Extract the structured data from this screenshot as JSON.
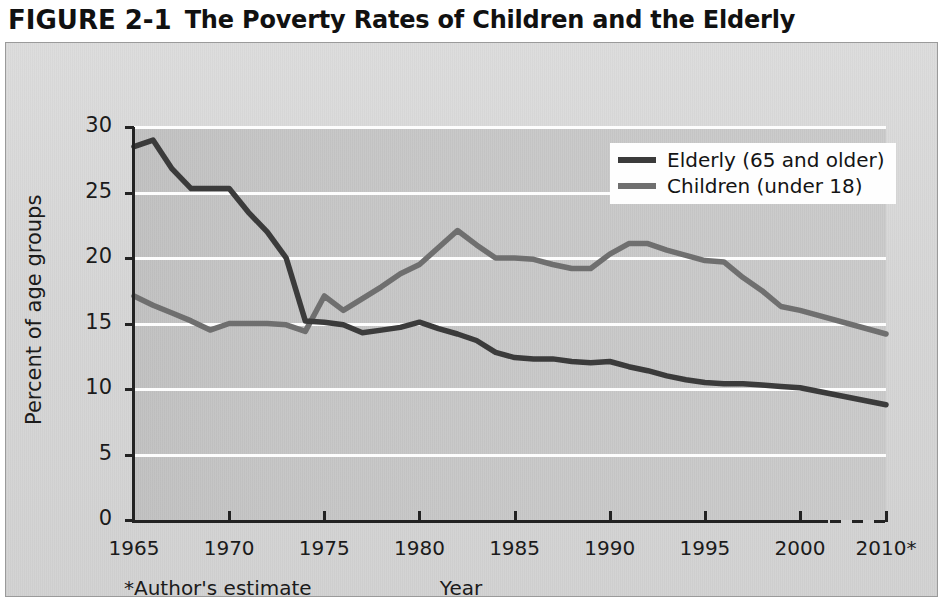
{
  "figure": {
    "number": "FIGURE 2-1",
    "title": "The Poverty Rates of Children and the Elderly"
  },
  "axes": {
    "y_title": "Percent of age groups",
    "x_title": "Year",
    "footnote": "*Author's estimate",
    "y_ticks": [
      "0",
      "5",
      "10",
      "15",
      "20",
      "25",
      "30"
    ],
    "x_ticks": [
      "1965",
      "1970",
      "1975",
      "1980",
      "1985",
      "1990",
      "1995",
      "2000",
      "2010*"
    ]
  },
  "legend": {
    "position": "top-right",
    "items": [
      {
        "label": "Elderly (65 and older)",
        "color": "#3b3b3b"
      },
      {
        "label": "Children (under 18)",
        "color": "#6f6f6f"
      }
    ]
  },
  "colors": {
    "elderly": "#3b3b3b",
    "children": "#6f6f6f",
    "plot_background": "#c6c6c6",
    "panel_background": "#d7d7d7",
    "gridline": "#fdfdfd",
    "axis": "#232323"
  },
  "chart_data": {
    "type": "line",
    "title": "The Poverty Rates of Children and the Elderly",
    "xlabel": "Year",
    "ylabel": "Percent of age groups",
    "xlim": [
      1965,
      2010
    ],
    "ylim": [
      0,
      30
    ],
    "y_ticks": [
      0,
      5,
      10,
      15,
      20,
      25,
      30
    ],
    "x_ticks": [
      1965,
      1970,
      1975,
      1980,
      1985,
      1990,
      1995,
      2000,
      2010
    ],
    "grid": "horizontal",
    "legend_position": "upper right",
    "note": "Axis becomes dashed after 2000; the 2010 value is the author's estimate.",
    "series": [
      {
        "name": "Elderly (65 and older)",
        "color": "#3b3b3b",
        "x": [
          1965,
          1966,
          1967,
          1968,
          1969,
          1970,
          1971,
          1972,
          1973,
          1974,
          1975,
          1976,
          1977,
          1978,
          1979,
          1980,
          1981,
          1982,
          1983,
          1984,
          1985,
          1986,
          1987,
          1988,
          1989,
          1990,
          1991,
          1992,
          1993,
          1994,
          1995,
          1996,
          1997,
          1998,
          1999,
          2000,
          2010
        ],
        "y": [
          28.5,
          29.0,
          26.8,
          25.3,
          25.3,
          25.3,
          23.5,
          22.0,
          20.0,
          15.2,
          15.1,
          14.9,
          14.3,
          14.5,
          14.7,
          15.1,
          14.6,
          14.2,
          13.7,
          12.8,
          12.4,
          12.3,
          12.3,
          12.1,
          12.0,
          12.1,
          11.7,
          11.4,
          11.0,
          10.7,
          10.5,
          10.4,
          10.4,
          10.3,
          10.2,
          10.1,
          8.8
        ]
      },
      {
        "name": "Children (under 18)",
        "color": "#6f6f6f",
        "x": [
          1965,
          1966,
          1967,
          1968,
          1969,
          1970,
          1971,
          1972,
          1973,
          1974,
          1975,
          1976,
          1977,
          1978,
          1979,
          1980,
          1981,
          1982,
          1983,
          1984,
          1985,
          1986,
          1987,
          1988,
          1989,
          1990,
          1991,
          1992,
          1993,
          1994,
          1995,
          1996,
          1997,
          1998,
          1999,
          2000,
          2010
        ],
        "y": [
          17.1,
          16.4,
          15.8,
          15.2,
          14.5,
          15.0,
          15.0,
          15.0,
          14.9,
          14.4,
          17.1,
          16.0,
          16.9,
          17.8,
          18.8,
          19.5,
          20.8,
          22.1,
          21.0,
          20.0,
          20.0,
          19.9,
          19.5,
          19.2,
          19.2,
          20.3,
          21.1,
          21.1,
          20.6,
          20.2,
          19.8,
          19.7,
          18.5,
          17.5,
          16.3,
          16.0,
          14.2
        ]
      }
    ]
  }
}
